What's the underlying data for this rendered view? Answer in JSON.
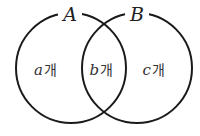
{
  "diagram": {
    "type": "venn",
    "sets": [
      {
        "id": "A",
        "label": "A"
      },
      {
        "id": "B",
        "label": "B"
      }
    ],
    "regions": [
      {
        "id": "only-A",
        "var": "a",
        "unit": "개"
      },
      {
        "id": "A-and-B",
        "var": "b",
        "unit": "개"
      },
      {
        "id": "only-B",
        "var": "c",
        "unit": "개"
      }
    ],
    "colors": {
      "stroke": "#1a1a1a",
      "background": "#ffffff"
    }
  }
}
